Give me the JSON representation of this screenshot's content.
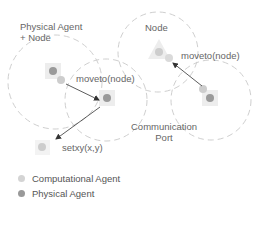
{
  "labels": {
    "physical_agent_node": "Physical Agent",
    "physical_agent_node_2": "+ Node",
    "node": "Node",
    "moveto_left": "moveto(node)",
    "moveto_right": "moveto(node)",
    "setxy": "setxy(x,y)",
    "communication_port_1": "Communication",
    "communication_port_2": "Port"
  },
  "legend": [
    {
      "label": "Computational Agent",
      "color": "#cccccc"
    },
    {
      "label": "Physical Agent",
      "color": "#999999"
    }
  ],
  "colors": {
    "circle_stroke": "#cfcfcf",
    "physical": "#9a9a9a",
    "computational": "#cdcdcd",
    "arrow": "#333333",
    "halo": "#ededed"
  }
}
